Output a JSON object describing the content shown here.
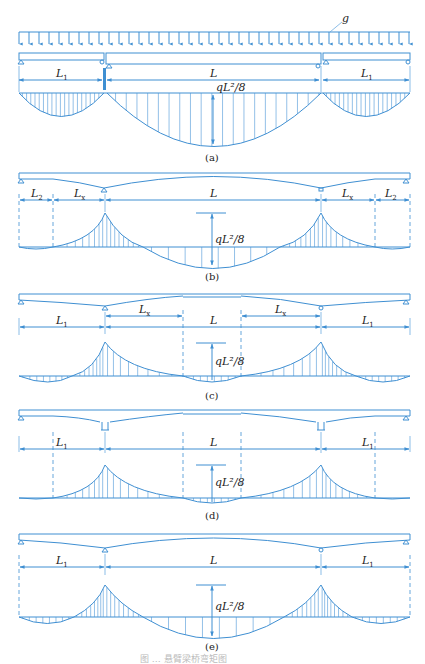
{
  "figure": {
    "load_label": "g",
    "moment_label": "qL²/8",
    "caption_text": "图 … 悬臂梁桥弯矩图",
    "colors": {
      "line": "#3f8fd2",
      "text": "#222222"
    },
    "panels": [
      {
        "id": "a",
        "caption": "(a)",
        "spans": [
          "L1",
          "L",
          "L1"
        ],
        "labels": {
          "left": "L",
          "left_sub": "1",
          "mid": "L",
          "right": "L",
          "right_sub": "1"
        }
      },
      {
        "id": "b",
        "caption": "(b)",
        "spans": [
          "L2",
          "Lx",
          "L",
          "Lx",
          "L2"
        ],
        "labels": {
          "l2": "L",
          "l2_sub": "2",
          "lx": "L",
          "lx_sub": "x",
          "mid": "L"
        }
      },
      {
        "id": "c",
        "caption": "(c)",
        "spans": [
          "L1",
          "Lx",
          "L",
          "Lx",
          "L1"
        ],
        "labels": {
          "l1": "L",
          "l1_sub": "1",
          "lx": "L",
          "lx_sub": "x",
          "mid": "L"
        }
      },
      {
        "id": "d",
        "caption": "(d)",
        "spans": [
          "L1",
          "L",
          "L1"
        ],
        "labels": {
          "l1": "L",
          "l1_sub": "1",
          "mid": "L"
        }
      },
      {
        "id": "e",
        "caption": "(e)",
        "spans": [
          "L1",
          "L",
          "L1"
        ],
        "labels": {
          "l1": "L",
          "l1_sub": "1",
          "mid": "L"
        }
      }
    ]
  }
}
